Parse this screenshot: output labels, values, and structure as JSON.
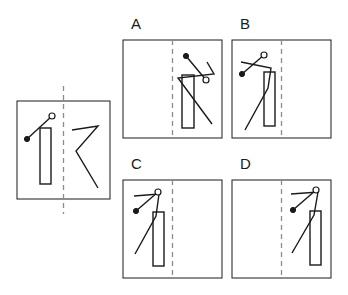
{
  "figure": {
    "kind": "spatial-reasoning-mirror-fold-task",
    "canvas": {
      "width": 348,
      "height": 295,
      "background": "#ffffff"
    },
    "stroke": {
      "color": "#1a1a1a",
      "width": 1.4,
      "dash_color": "#8c8c8c",
      "dash_pattern": "5 4"
    }
  },
  "reference": {
    "name": "reference-panel",
    "box": {
      "x": 17,
      "y": 101,
      "w": 93,
      "h": 98
    },
    "fold_line": {
      "x": 63.5,
      "y_top": 86,
      "y_bottom": 214,
      "orientation": "vertical",
      "style": "dashed"
    },
    "left_half": {
      "rectangle": {
        "x": 40,
        "y": 128,
        "w": 11,
        "h": 56
      },
      "segment": {
        "filled_dot": {
          "x": 27,
          "y": 139,
          "r": 2.6
        },
        "open_circle": {
          "x": 52,
          "y": 116,
          "r": 3.0
        }
      }
    },
    "right_half": {
      "zigzag": [
        {
          "x": 72,
          "y": 130
        },
        {
          "x": 98,
          "y": 126
        },
        {
          "x": 76,
          "y": 151
        },
        {
          "x": 98,
          "y": 188
        }
      ]
    }
  },
  "options": [
    {
      "id": "A",
      "label": "A",
      "box": {
        "x": 123,
        "y": 40,
        "w": 99,
        "h": 98
      },
      "fold_line": {
        "x": 172.5,
        "y_top": 40,
        "y_bottom": 138
      },
      "content_side": "right",
      "rectangle": {
        "x": 182,
        "y": 75,
        "w": 12,
        "h": 53
      },
      "zigzag": [
        {
          "x": 207,
          "y": 62
        },
        {
          "x": 214,
          "y": 74
        },
        {
          "x": 178,
          "y": 78
        },
        {
          "x": 212,
          "y": 124
        }
      ],
      "segment": {
        "filled_dot": {
          "x": 186,
          "y": 56,
          "r": 2.6
        },
        "open_circle": {
          "x": 206,
          "y": 80,
          "r": 3.0
        }
      }
    },
    {
      "id": "B",
      "label": "B",
      "box": {
        "x": 232,
        "y": 40,
        "w": 99,
        "h": 98
      },
      "fold_line": {
        "x": 281.5,
        "y_top": 40,
        "y_bottom": 138
      },
      "content_side": "left",
      "rectangle": {
        "x": 264,
        "y": 72,
        "w": 11,
        "h": 54
      },
      "zigzag": [
        {
          "x": 241,
          "y": 62
        },
        {
          "x": 271,
          "y": 68
        },
        {
          "x": 268,
          "y": 88
        },
        {
          "x": 245,
          "y": 130
        }
      ],
      "segment": {
        "filled_dot": {
          "x": 242,
          "y": 74
        },
        "open_circle": {
          "x": 264,
          "y": 55
        }
      }
    },
    {
      "id": "C",
      "label": "C",
      "box": {
        "x": 123,
        "y": 180,
        "w": 99,
        "h": 98
      },
      "fold_line": {
        "x": 172.5,
        "y_top": 180,
        "y_bottom": 278
      },
      "content_side": "left",
      "rectangle": {
        "x": 153,
        "y": 212,
        "w": 11,
        "h": 54
      },
      "zigzag": [
        {
          "x": 134,
          "y": 196
        },
        {
          "x": 159,
          "y": 194
        },
        {
          "x": 156,
          "y": 216
        },
        {
          "x": 135,
          "y": 254
        }
      ],
      "segment": {
        "filled_dot": {
          "x": 136,
          "y": 211
        },
        "open_circle": {
          "x": 158,
          "y": 192
        }
      }
    },
    {
      "id": "D",
      "label": "D",
      "box": {
        "x": 232,
        "y": 180,
        "w": 99,
        "h": 98
      },
      "fold_line": {
        "x": 281.5,
        "y_top": 180,
        "y_bottom": 278
      },
      "content_side": "right",
      "rectangle": {
        "x": 310,
        "y": 211,
        "w": 11,
        "h": 54
      },
      "zigzag": [
        {
          "x": 291,
          "y": 194
        },
        {
          "x": 318,
          "y": 192
        },
        {
          "x": 314,
          "y": 215
        },
        {
          "x": 292,
          "y": 253
        }
      ],
      "segment": {
        "filled_dot": {
          "x": 293,
          "y": 210
        },
        "open_circle": {
          "x": 316,
          "y": 190
        }
      }
    }
  ]
}
